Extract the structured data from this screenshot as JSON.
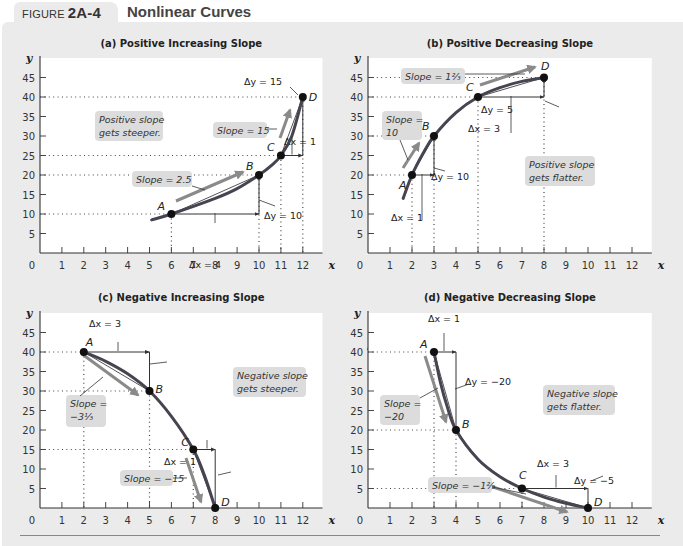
{
  "figure": {
    "label_prefix": "FIGURE",
    "label_number": "2A-4",
    "title": "Nonlinear Curves"
  },
  "colors": {
    "background": "#ebebeb",
    "plot_area": "#ffffff",
    "curve": "#474350",
    "slope_arrow": "#8a8a8a",
    "label_box": "#dcdcdc",
    "axis": "#333333"
  },
  "chart_data": [
    {
      "id": "a",
      "type": "line",
      "title": "(a) Positive Increasing Slope",
      "xlabel": "x",
      "ylabel": "y",
      "x_ticks": [
        0,
        1,
        2,
        3,
        4,
        5,
        6,
        7,
        8,
        9,
        10,
        11,
        12
      ],
      "y_ticks": [
        5,
        10,
        15,
        20,
        25,
        30,
        35,
        40,
        45
      ],
      "xlim": [
        0,
        12.9
      ],
      "ylim": [
        0,
        50
      ],
      "grid": false,
      "points": [
        {
          "label": "A",
          "x": 6,
          "y": 10
        },
        {
          "label": "B",
          "x": 10,
          "y": 20
        },
        {
          "label": "C",
          "x": 11,
          "y": 25
        },
        {
          "label": "D",
          "x": 12,
          "y": 40
        }
      ],
      "curve": [
        [
          5.1,
          8.5
        ],
        [
          6,
          10
        ],
        [
          8,
          14
        ],
        [
          9,
          16.5
        ],
        [
          10,
          20
        ],
        [
          10.6,
          22.6
        ],
        [
          11,
          25
        ],
        [
          11.5,
          30
        ],
        [
          12,
          40
        ]
      ],
      "segments": [
        {
          "from": "A",
          "to": "B",
          "dx_label": "Δx = 4",
          "dy_label": "Δy = 10",
          "slope_label": "Slope = 2.5"
        },
        {
          "from": "C",
          "to": "D",
          "dx_label": "Δx = 1",
          "dy_label": "Δy = 15",
          "slope_label": "Slope = 15"
        }
      ],
      "note": [
        "Positive slope",
        "gets steeper."
      ]
    },
    {
      "id": "b",
      "type": "line",
      "title": "(b) Positive Decreasing Slope",
      "xlabel": "x",
      "ylabel": "y",
      "x_ticks": [
        0,
        1,
        2,
        3,
        4,
        5,
        6,
        7,
        8,
        9,
        10,
        11,
        12
      ],
      "y_ticks": [
        5,
        10,
        15,
        20,
        25,
        30,
        35,
        40,
        45
      ],
      "xlim": [
        0,
        12.9
      ],
      "ylim": [
        0,
        50
      ],
      "grid": false,
      "points": [
        {
          "label": "A",
          "x": 2,
          "y": 20
        },
        {
          "label": "B",
          "x": 3,
          "y": 30
        },
        {
          "label": "C",
          "x": 5,
          "y": 40
        },
        {
          "label": "D",
          "x": 8,
          "y": 45
        }
      ],
      "curve": [
        [
          1.6,
          14
        ],
        [
          2,
          20
        ],
        [
          2.5,
          25.5
        ],
        [
          3,
          30
        ],
        [
          4,
          36
        ],
        [
          5,
          40
        ],
        [
          6,
          42.4
        ],
        [
          7,
          44
        ],
        [
          8,
          45
        ]
      ],
      "segments": [
        {
          "from": "A",
          "to": "B",
          "dx_label": "Δx = 1",
          "dy_label": "Δy = 10",
          "slope_label": "Slope = 10"
        },
        {
          "from": "C",
          "to": "D",
          "dx_label": "Δx = 3",
          "dy_label": "Δy = 5",
          "slope_label": "Slope = 1⅔"
        }
      ],
      "note": [
        "Positive slope",
        "gets flatter."
      ]
    },
    {
      "id": "c",
      "type": "line",
      "title": "(c) Negative Increasing Slope",
      "xlabel": "x",
      "ylabel": "y",
      "x_ticks": [
        0,
        1,
        2,
        3,
        4,
        5,
        6,
        7,
        8,
        9,
        10,
        11,
        12
      ],
      "y_ticks": [
        5,
        10,
        15,
        20,
        25,
        30,
        35,
        40,
        45
      ],
      "xlim": [
        0,
        12.9
      ],
      "ylim": [
        0,
        50
      ],
      "grid": false,
      "points": [
        {
          "label": "A",
          "x": 2,
          "y": 40
        },
        {
          "label": "B",
          "x": 5,
          "y": 30
        },
        {
          "label": "C",
          "x": 7,
          "y": 15
        },
        {
          "label": "D",
          "x": 8,
          "y": 0
        }
      ],
      "curve": [
        [
          2,
          40
        ],
        [
          3,
          37.6
        ],
        [
          4,
          34.4
        ],
        [
          5,
          30
        ],
        [
          6,
          23.5
        ],
        [
          7,
          15
        ],
        [
          7.5,
          8.5
        ],
        [
          8,
          0
        ]
      ],
      "segments": [
        {
          "from": "A",
          "to": "B",
          "dx_label": "Δx = 3",
          "dy_label": "Δy = −10",
          "slope_label": "Slope = −3⅓"
        },
        {
          "from": "C",
          "to": "D",
          "dx_label": "Δx = 1",
          "dy_label": "Δy = −15",
          "slope_label": "Slope = −15"
        }
      ],
      "note": [
        "Negative slope",
        "gets steeper."
      ]
    },
    {
      "id": "d",
      "type": "line",
      "title": "(d) Negative Decreasing Slope",
      "xlabel": "x",
      "ylabel": "y",
      "x_ticks": [
        0,
        1,
        2,
        3,
        4,
        5,
        6,
        7,
        8,
        9,
        10,
        11,
        12
      ],
      "y_ticks": [
        5,
        10,
        15,
        20,
        25,
        30,
        35,
        40,
        45
      ],
      "xlim": [
        0,
        12.9
      ],
      "ylim": [
        0,
        50
      ],
      "grid": false,
      "points": [
        {
          "label": "A",
          "x": 3,
          "y": 40
        },
        {
          "label": "B",
          "x": 4,
          "y": 20
        },
        {
          "label": "C",
          "x": 7,
          "y": 5
        },
        {
          "label": "D",
          "x": 10,
          "y": 0
        }
      ],
      "curve": [
        [
          3,
          40
        ],
        [
          3.3,
          32
        ],
        [
          3.6,
          26
        ],
        [
          4,
          20
        ],
        [
          5,
          12.5
        ],
        [
          6,
          8
        ],
        [
          7,
          5
        ],
        [
          8,
          2.8
        ],
        [
          9,
          1.2
        ],
        [
          10,
          0
        ]
      ],
      "segments": [
        {
          "from": "A",
          "to": "B",
          "dx_label": "Δx = 1",
          "dy_label": "Δy = −20",
          "slope_label": "Slope = −20"
        },
        {
          "from": "C",
          "to": "D",
          "dx_label": "Δx = 3",
          "dy_label": "Δy = −5",
          "slope_label": "Slope = −1⅔"
        }
      ],
      "note": [
        "Negative slope",
        "gets flatter."
      ]
    }
  ]
}
